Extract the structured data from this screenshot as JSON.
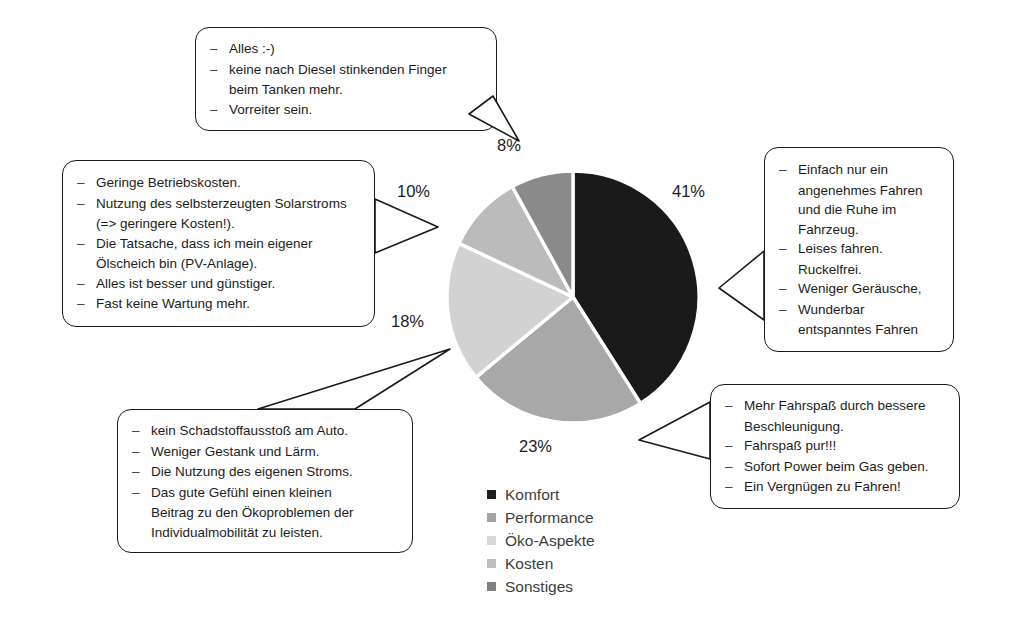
{
  "chart_data": {
    "type": "pie",
    "title": "",
    "categories": [
      "Komfort",
      "Performance",
      "Öko-Aspekte",
      "Kosten",
      "Sonstiges"
    ],
    "values": [
      41,
      23,
      18,
      10,
      8
    ],
    "value_labels": [
      "41%",
      "23%",
      "18%",
      "10%",
      "8%"
    ],
    "unit": "%",
    "colors": [
      "#1a1a1a",
      "#a8a8a8",
      "#d2d2d2",
      "#bbbbbb",
      "#8a8a8a"
    ],
    "start_angle_deg": 0,
    "direction": "clockwise",
    "legend_position": "bottom",
    "grid": false
  },
  "legend": {
    "items": [
      {
        "label": "Komfort",
        "color": "#1f1f1f"
      },
      {
        "label": "Performance",
        "color": "#a3a3a3"
      },
      {
        "label": "Öko-Aspekte",
        "color": "#d8d8d8"
      },
      {
        "label": "Kosten",
        "color": "#bdbdbd"
      },
      {
        "label": "Sonstiges",
        "color": "#808080"
      }
    ]
  },
  "callouts": {
    "top": {
      "target": "Sonstiges",
      "items": [
        "Alles :-)",
        "keine nach Diesel stinkenden Finger",
        "Vorreiter sein."
      ],
      "cont_after_1": "beim Tanken mehr."
    },
    "left": {
      "target": "Kosten",
      "items": [
        "Geringe Betriebskosten.",
        "Nutzung des selbsterzeugten Solarstroms",
        "Die Tatsache, dass ich mein eigener",
        "Alles ist besser und günstiger.",
        "Fast keine Wartung mehr."
      ],
      "cont_after_2": "(=> geringere Kosten!).",
      "cont_after_3": "Ölscheich bin (PV-Anlage)."
    },
    "right": {
      "target": "Komfort",
      "items": [
        "Einfach nur ein",
        "Leises fahren.",
        "Weniger Geräusche,",
        "Wunderbar"
      ],
      "cont_a": "angenehmes Fahren",
      "cont_b": "und die Ruhe im",
      "cont_c": "Fahrzeug.",
      "cont_d": "Ruckelfrei.",
      "cont_e": "entspanntes Fahren"
    },
    "bottom_right": {
      "target": "Performance",
      "items": [
        "Mehr Fahrspaß durch bessere",
        "Fahrspaß pur!!!",
        "Sofort Power beim Gas geben.",
        "Ein Vergnügen zu Fahren!"
      ],
      "cont_after_1": "Beschleunigung."
    },
    "bottom_left": {
      "target": "Öko-Aspekte",
      "items": [
        "kein Schadstoffausstoß am Auto.",
        "Weniger Gestank und Lärm.",
        "Die Nutzung des eigenen Stroms.",
        "Das gute Gefühl einen kleinen"
      ],
      "cont_a": "Beitrag zu den Ökoproblemen der",
      "cont_b": "Individualmobilität zu leisten."
    }
  }
}
